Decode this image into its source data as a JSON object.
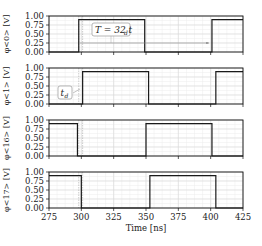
{
  "chart_data": {
    "type": "line",
    "title": "",
    "xlabel": "Time [ns]",
    "xlim": [
      275,
      425
    ],
    "xticks": [
      275,
      300,
      325,
      350,
      375,
      400,
      425
    ],
    "xtick_labels": [
      "275",
      "300",
      "325",
      "350",
      "375",
      "400",
      "425"
    ],
    "ylim": [
      0,
      1.0
    ],
    "yticks": [
      0.0,
      0.25,
      0.5,
      0.75,
      1.0
    ],
    "ytick_labels": [
      "0.00",
      "0.25",
      "0.50",
      "0.75",
      "1.00"
    ],
    "grid": true,
    "legend": null,
    "subplots": [
      {
        "ylabel": "φ<0> [V]",
        "signal": {
          "x": [
            275,
            298,
            298,
            349,
            349,
            401,
            401,
            425
          ],
          "y": [
            0,
            0,
            0.9,
            0.9,
            0,
            0,
            0.9,
            0.9
          ]
        }
      },
      {
        "ylabel": "φ<1> [V]",
        "signal": {
          "x": [
            275,
            301,
            301,
            352,
            352,
            404,
            404,
            425
          ],
          "y": [
            0,
            0,
            0.9,
            0.9,
            0,
            0,
            0.9,
            0.9
          ]
        }
      },
      {
        "ylabel": "φ<16> [V]",
        "signal": {
          "x": [
            275,
            297,
            297,
            350,
            350,
            401,
            401,
            425
          ],
          "y": [
            0.9,
            0.9,
            0,
            0,
            0.9,
            0.9,
            0,
            0
          ]
        }
      },
      {
        "ylabel": "φ<17> [V]",
        "signal": {
          "x": [
            275,
            300,
            300,
            353,
            353,
            404,
            404,
            425
          ],
          "y": [
            0.9,
            0.9,
            0,
            0,
            0.9,
            0.9,
            0,
            0
          ]
        }
      }
    ],
    "annotations": [
      {
        "text": "T = 32 t_d",
        "subplot": 0,
        "arrow_from_x": 298,
        "arrow_to_x": 401,
        "arrow_y": 0.25
      },
      {
        "text": "t_d",
        "subplot": 1,
        "between_x": [
          298,
          301
        ]
      }
    ],
    "vlines": [
      298,
      301
    ]
  },
  "labels": {
    "xlabel": "Time [ns]",
    "annot_T": "T = 32",
    "annot_T_sub": "d",
    "annot_td": "t",
    "annot_td_sub": "d"
  }
}
